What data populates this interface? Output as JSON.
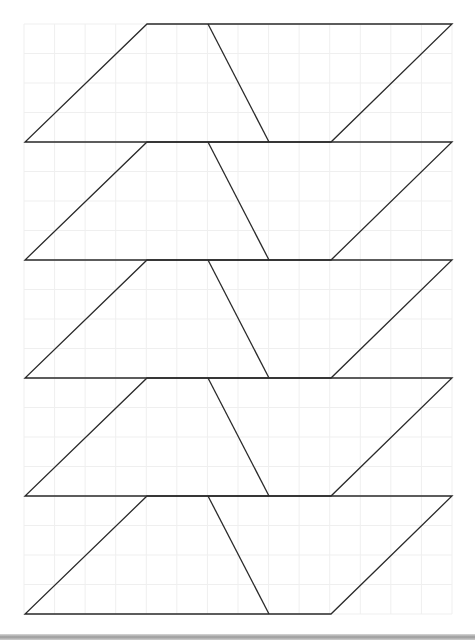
{
  "diagram": {
    "grid": {
      "x_start": 24,
      "x_end": 452,
      "columns": 14,
      "y_start": 24,
      "y_end": 614,
      "rows": 20,
      "color": "#efefef"
    },
    "stroke_color": "#2a2a2a",
    "shapes": [
      {
        "label": "Shape 1",
        "top_y": 24,
        "bottom_y": 142
      },
      {
        "label": "Shape 2",
        "top_y": 142,
        "bottom_y": 260
      },
      {
        "label": "Shape 3",
        "top_y": 260,
        "bottom_y": 378
      },
      {
        "label": "Shape 4",
        "top_y": 378,
        "bottom_y": 496
      },
      {
        "label": "Shape 5",
        "top_y": 496,
        "bottom_y": 614
      }
    ],
    "shape_x": {
      "top_left": 147,
      "top_divider": 208,
      "top_right": 452,
      "bottom_left": 25,
      "bottom_divider": 269,
      "bottom_right": 331
    }
  }
}
